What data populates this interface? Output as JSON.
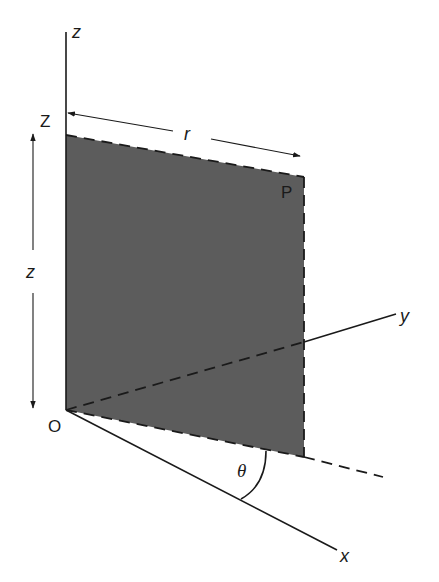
{
  "figure": {
    "type": "cylindrical-coordinates-diagram",
    "colors": {
      "background": "#ffffff",
      "ink": "#1a1a1a",
      "shaded_plane": "#5c5c5c"
    },
    "axes": {
      "z": {
        "label": "z"
      },
      "y": {
        "label": "y"
      },
      "x": {
        "label": "x"
      }
    },
    "points": {
      "origin": {
        "label": "O"
      },
      "height_point": {
        "label": "Z"
      },
      "point": {
        "label": "P"
      }
    },
    "dimensions": {
      "radial": {
        "label": "r"
      },
      "vertical": {
        "label": "z"
      },
      "angle": {
        "label": "θ"
      }
    }
  }
}
